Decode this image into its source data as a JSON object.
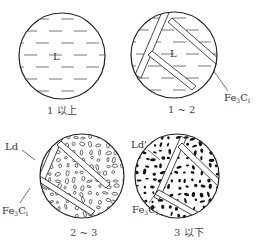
{
  "figure": {
    "panels": [
      {
        "id": "p1",
        "caption": "1 以上",
        "phase_label": "L",
        "phase_label_2": null,
        "pointer_labels": []
      },
      {
        "id": "p2",
        "caption": "1 ~ 2",
        "phase_label": "L",
        "pointer_labels": [
          {
            "main": "Fe",
            "s1": "3",
            "mid": "C",
            "s2": "Ⅰ"
          }
        ]
      },
      {
        "id": "p3",
        "caption": "2 ~ 3",
        "pointer_labels": [
          {
            "text": "Ld"
          },
          {
            "main": "Fe",
            "s1": "3",
            "mid": "C",
            "s2": "Ⅰ"
          }
        ]
      },
      {
        "id": "p4",
        "caption": "3 以下",
        "pointer_labels": [
          {
            "text": "Ld'"
          },
          {
            "main": "Fe",
            "s1": "3",
            "mid": "C",
            "s2": "Ⅰ"
          }
        ]
      }
    ]
  }
}
